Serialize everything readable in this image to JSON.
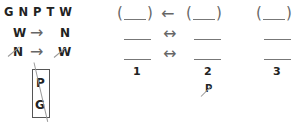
{
  "left": {
    "letters_row": "G N P T W",
    "rule1": {
      "from": "W",
      "to": "N",
      "arrow": "→",
      "crossed": false
    },
    "rule2": {
      "from": "N",
      "to": "W",
      "arrow": "→",
      "crossed": true
    },
    "box": {
      "top": "P",
      "bottom": "G",
      "crossed": true
    }
  },
  "right": {
    "columns": [
      {
        "label": "1"
      },
      {
        "label": "2",
        "note": "P",
        "note_crossed": true
      },
      {
        "label": "3"
      }
    ],
    "arrows": {
      "top": "←",
      "middle": "↔",
      "bottom": "↔"
    },
    "paren_open": "(",
    "paren_close": ")"
  }
}
